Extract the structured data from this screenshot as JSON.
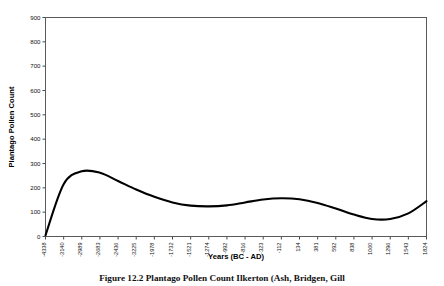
{
  "figure": {
    "caption": "Figure 12.2  Plantago Pollen Count Ilkerton (Ash, Bridgen, Gill"
  },
  "chart_data": {
    "type": "line",
    "title": "",
    "xlabel": "Years (BC - AD)",
    "ylabel": "Plantago Pollen Count",
    "ylim": [
      0,
      900
    ],
    "ytick_values": [
      0,
      100,
      200,
      300,
      400,
      500,
      600,
      700,
      800,
      900
    ],
    "ytick_labels": [
      "0",
      "100",
      "200",
      "300",
      "400",
      "500",
      "600",
      "700",
      "800",
      "900"
    ],
    "grid": false,
    "legend": "none",
    "xtick_labels": [
      "-4338",
      "-3140",
      "-2989",
      "-2683",
      "-2436",
      "-3225",
      "-1978",
      "-1732",
      "-1521",
      "-1274",
      "-992",
      "-816",
      "-323",
      "-112",
      "134",
      "381",
      "592",
      "838",
      "1060",
      "1296",
      "1543",
      "1824"
    ],
    "series": [
      {
        "name": "Plantago Pollen Count",
        "x": [
          "-4338",
          "-3140",
          "-2989",
          "-2683",
          "-2436",
          "-3225",
          "-1978",
          "-1732",
          "-1521",
          "-1274",
          "-992",
          "-816",
          "-323",
          "-112",
          "134",
          "381",
          "592",
          "838",
          "1060",
          "1296",
          "1543",
          "1824"
        ],
        "values": [
          5,
          215,
          268,
          262,
          228,
          193,
          163,
          140,
          127,
          124,
          128,
          140,
          152,
          157,
          153,
          138,
          115,
          90,
          72,
          72,
          95,
          145
        ]
      }
    ]
  }
}
